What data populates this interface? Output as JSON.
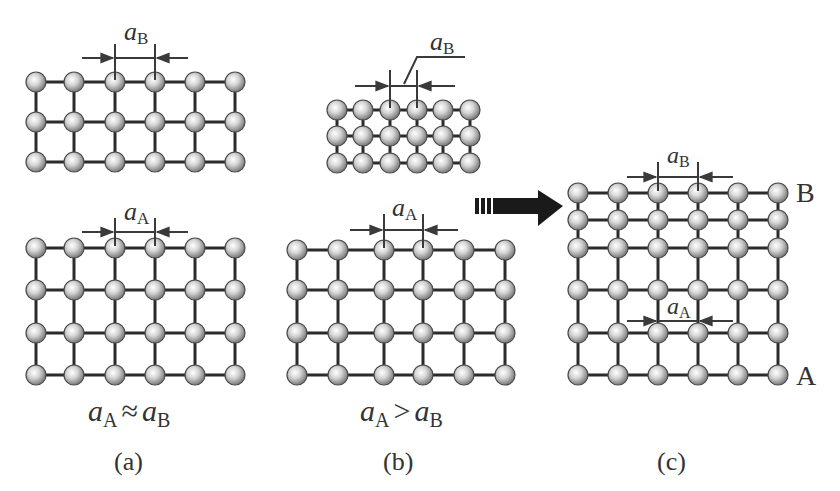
{
  "figure": {
    "panels": [
      {
        "id": "a",
        "caption": "(a)",
        "relation": {
          "lhs": "a",
          "lhs_sub": "A",
          "op": "≈",
          "rhs": "a",
          "rhs_sub": "B"
        },
        "top_lattice": {
          "label": "a",
          "label_sub": "B",
          "xs": [
            36,
            74,
            115,
            155,
            195,
            235
          ],
          "ys": [
            82,
            122,
            162
          ]
        },
        "bottom_lattice": {
          "label": "a",
          "label_sub": "A",
          "xs": [
            36,
            74,
            115,
            155,
            195,
            235
          ],
          "ys": [
            248,
            290,
            333,
            375
          ]
        }
      },
      {
        "id": "b",
        "caption": "(b)",
        "relation": {
          "lhs": "a",
          "lhs_sub": "A",
          "op": ">",
          "rhs": "a",
          "rhs_sub": "B"
        },
        "top_lattice": {
          "label": "a",
          "label_sub": "B",
          "xs": [
            337,
            363,
            390,
            417,
            443,
            470
          ],
          "ys": [
            110,
            136,
            163
          ]
        },
        "bottom_lattice": {
          "label": "a",
          "label_sub": "A",
          "xs": [
            297,
            338,
            384,
            423,
            464,
            505
          ],
          "ys": [
            250,
            290,
            333,
            375
          ]
        }
      },
      {
        "id": "c",
        "caption": "(c)",
        "layer_top_label": "B",
        "layer_bottom_label": "A",
        "top_spacing_label": "a",
        "top_spacing_sub": "B",
        "bottom_spacing_label": "a",
        "bottom_spacing_sub": "A",
        "lattice": {
          "xs": [
            578,
            618,
            658,
            698,
            738,
            778
          ],
          "ys": [
            193,
            220,
            248,
            290,
            333,
            375
          ]
        }
      }
    ],
    "arrow": {
      "direction": "right",
      "meaning": "transition-to-heteroepitaxial-interface"
    },
    "colors": {
      "atom_light": "#f2f2f2",
      "atom_dark": "#7a7a7a",
      "bond": "#2b2b2b",
      "arrow": "#1a1a1a"
    }
  }
}
